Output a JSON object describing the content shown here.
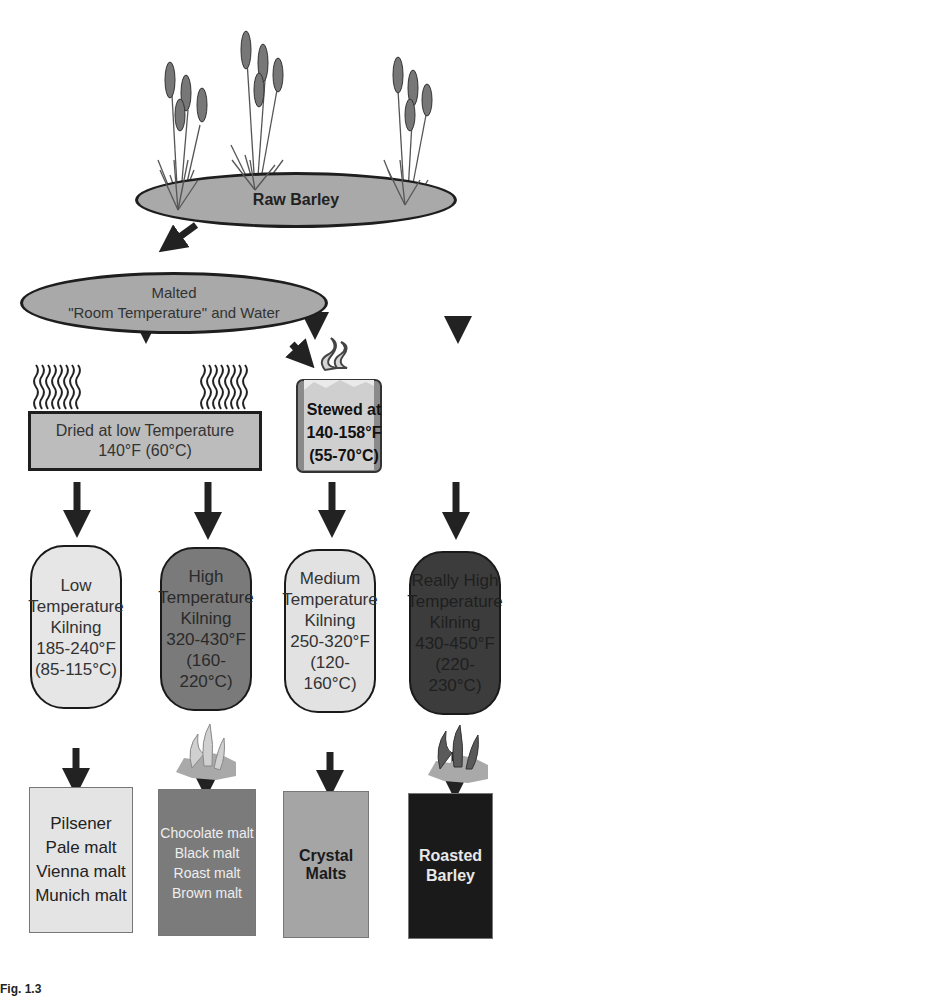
{
  "diagram": {
    "source_node": {
      "label": "Raw Barley"
    },
    "malting_node": {
      "line1": "Malted",
      "line2": "\"Room Temperature\" and Water"
    },
    "drying_node": {
      "line1": "Dried at low Temperature",
      "line2": "140°F (60°C)"
    },
    "stewing_node": {
      "line1": "Stewed at",
      "line2": "140-158°F",
      "line3": "(55-70°C)"
    },
    "kilning_nodes": [
      {
        "lines": [
          "Low",
          "Temperature",
          "Kilning",
          "185-240°F",
          "(85-115°C)"
        ],
        "fill": "#e6e6e6",
        "text_color": "#333333"
      },
      {
        "lines": [
          "High",
          "Temperature",
          "Kilning",
          "320-430°F",
          "(160-220°C)"
        ],
        "fill": "#7a7a7a",
        "text_color": "#2a2a2a"
      },
      {
        "lines": [
          "Medium",
          "Temperature",
          "Kilning",
          "250-320°F",
          "(120-160°C)"
        ],
        "fill": "#e2e2e2",
        "text_color": "#333333"
      },
      {
        "lines": [
          "Really High",
          "Temperature",
          "Kilning",
          "430-450°F",
          "(220-230°C)"
        ],
        "fill": "#3c3c3c",
        "text_color": "#1f1f1f"
      }
    ],
    "product_nodes": [
      {
        "lines": [
          "Pilsener",
          "Pale malt",
          "Vienna malt",
          "Munich malt"
        ],
        "fill": "#e4e4e4",
        "text_color": "#222222"
      },
      {
        "lines": [
          "Chocolate malt",
          "Black malt",
          "Roast malt",
          "Brown malt"
        ],
        "fill": "#7b7b7b",
        "text_color": "#eeeeee"
      },
      {
        "lines": [
          "Crystal Malts"
        ],
        "fill": "#a5a5a5",
        "text_color": "#1a1a1a"
      },
      {
        "lines": [
          "Roasted",
          "Barley"
        ],
        "fill": "#1a1a1a",
        "text_color": "#e8e8e8"
      }
    ],
    "icons": [
      "barley-plant-icon",
      "heat-wave-icon",
      "steaming-pot-icon",
      "campfire-icon",
      "down-arrow-icon"
    ],
    "caption": "Fig. 1.3"
  }
}
